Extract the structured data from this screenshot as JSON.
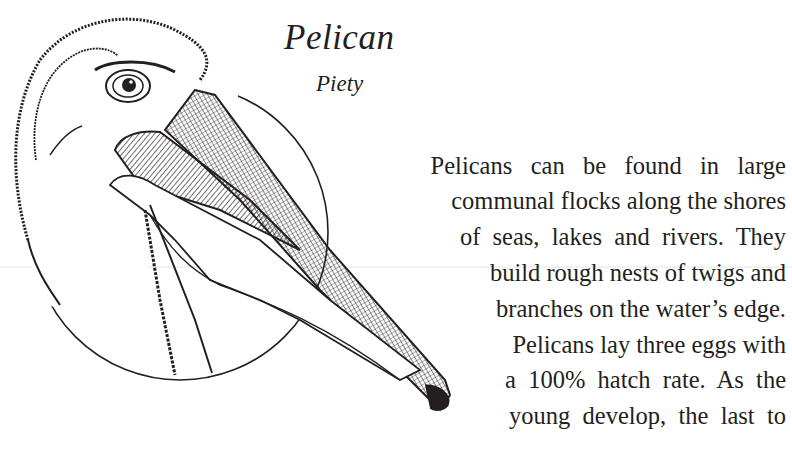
{
  "heading": {
    "title": "Pelican",
    "subtitle": "Piety"
  },
  "illustration": {
    "subject": "pelican-head-ink-drawing",
    "background_shape": "circle"
  },
  "body": {
    "lines": [
      "Pelicans   can   be   found   in   large",
      "communal flocks along the shores",
      "of  seas,  lakes  and  rivers.  They",
      "build rough nests of twigs and",
      "branches on the water’s edge.",
      "Pelicans lay three eggs with",
      "a  100%  hatch  rate.  As  the",
      "young  develop,  the  last  to"
    ]
  },
  "colors": {
    "ink": "#231f20",
    "paper": "#ffffff"
  }
}
